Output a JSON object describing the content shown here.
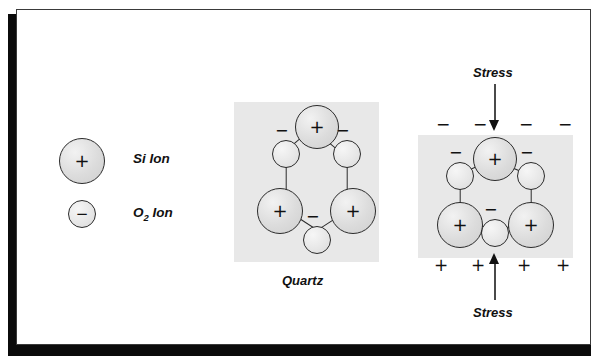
{
  "figure": {
    "background_color": "#ffffff",
    "panel_color": "#e8e8e8",
    "ion_outline_color": "#2b2b2b"
  },
  "legend": {
    "items": [
      {
        "symbol": "+",
        "label": "Si  Ion",
        "label_main": "Si  Ion",
        "kind": "si",
        "size_px": 46
      },
      {
        "symbol": "−",
        "label": "O2 Ion",
        "label_main": "O",
        "label_sub": "2",
        "label_tail": " Ion",
        "kind": "o2",
        "size_px": 27
      }
    ]
  },
  "unstressed": {
    "caption": "Quartz",
    "ions": [
      {
        "id": "si-top",
        "symbol": "+",
        "kind": "si"
      },
      {
        "id": "o-upper-left",
        "symbol": "−",
        "kind": "o2"
      },
      {
        "id": "o-upper-right",
        "symbol": "−",
        "kind": "o2"
      },
      {
        "id": "si-lower-left",
        "symbol": "+",
        "kind": "si"
      },
      {
        "id": "si-lower-right",
        "symbol": "+",
        "kind": "si"
      },
      {
        "id": "o-bottom",
        "symbol": "−",
        "kind": "o2"
      }
    ],
    "external_signs": []
  },
  "stressed": {
    "caption": "",
    "stress_label_top": "Stress",
    "stress_label_bottom": "Stress",
    "top_charges": [
      "−",
      "−",
      "−",
      "−"
    ],
    "bottom_charges": [
      "+",
      "+",
      "+",
      "+"
    ],
    "ions": [
      {
        "id": "si-top",
        "symbol": "+",
        "kind": "si"
      },
      {
        "id": "o-upper-left",
        "symbol": "−",
        "kind": "o2"
      },
      {
        "id": "o-upper-right",
        "symbol": "−",
        "kind": "o2"
      },
      {
        "id": "si-lower-left",
        "symbol": "+",
        "kind": "si"
      },
      {
        "id": "si-lower-right",
        "symbol": "+",
        "kind": "si"
      },
      {
        "id": "o-bottom",
        "symbol": "−",
        "kind": "o2"
      }
    ]
  }
}
